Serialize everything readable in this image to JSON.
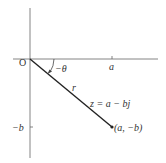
{
  "diagram": {
    "origin_label": "O",
    "angle_label": "−θ",
    "x_tick_label": "a",
    "y_tick_label": "−b",
    "radius_label": "r",
    "equation_label": "z = a − bj",
    "point_label": "(a, −b)",
    "colors": {
      "axis": "#555555",
      "vector": "#222222",
      "text": "#333333"
    }
  }
}
